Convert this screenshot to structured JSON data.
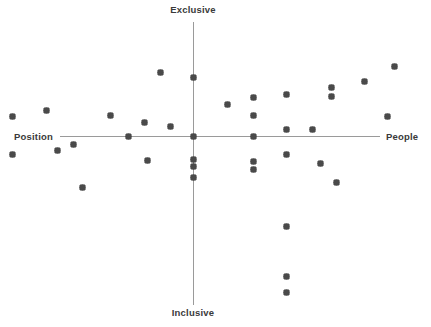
{
  "chart_data": {
    "type": "scatter",
    "title": "",
    "subtitle": "",
    "xlabel": "",
    "ylabel": "",
    "xlim": [
      -100,
      100
    ],
    "ylim": [
      -100,
      100
    ],
    "grid": false,
    "legend": null,
    "legend_position": "none",
    "axis_labels": {
      "top": "Exclusive",
      "bottom": "Inclusive",
      "left": "Position",
      "right": "People"
    },
    "axis_color": "#9a9a9a",
    "marker_color": "#4a4a4a",
    "marker_shape": "diamond",
    "series": [
      {
        "name": "items",
        "points": [
          {
            "x": -89.6,
            "y": 13.4
          },
          {
            "x": -73.1,
            "y": 17.7
          },
          {
            "x": -89.6,
            "y": -12.7
          },
          {
            "x": -67.2,
            "y": -9.9
          },
          {
            "x": -59.7,
            "y": -6.3
          },
          {
            "x": -55.2,
            "y": -36.4
          },
          {
            "x": -41.0,
            "y": 14.1
          },
          {
            "x": -32.1,
            "y": 0.0
          },
          {
            "x": -23.9,
            "y": 9.2
          },
          {
            "x": -22.4,
            "y": -17.6
          },
          {
            "x": -16.4,
            "y": 44.4
          },
          {
            "x": -11.2,
            "y": 7.0
          },
          {
            "x": 0.0,
            "y": 41.0
          },
          {
            "x": 0.0,
            "y": 0.0
          },
          {
            "x": 0.0,
            "y": -16.9
          },
          {
            "x": 0.0,
            "y": -21.8
          },
          {
            "x": 0.0,
            "y": -28.9
          },
          {
            "x": 17.2,
            "y": 22.5
          },
          {
            "x": 29.9,
            "y": 26.8
          },
          {
            "x": 29.9,
            "y": 14.1
          },
          {
            "x": 29.9,
            "y": 0.0
          },
          {
            "x": 29.9,
            "y": -18.3
          },
          {
            "x": 29.9,
            "y": -23.9
          },
          {
            "x": 46.3,
            "y": 28.9
          },
          {
            "x": 46.3,
            "y": 4.9
          },
          {
            "x": 46.3,
            "y": -12.7
          },
          {
            "x": 46.3,
            "y": -63.4
          },
          {
            "x": 46.3,
            "y": -98.6
          },
          {
            "x": 46.3,
            "y": -109.9
          },
          {
            "x": 59.7,
            "y": 4.9
          },
          {
            "x": 63.4,
            "y": -19.7
          },
          {
            "x": 68.7,
            "y": 34.5
          },
          {
            "x": 68.7,
            "y": 27.5
          },
          {
            "x": 71.6,
            "y": -32.4
          },
          {
            "x": 85.1,
            "y": 38.7
          },
          {
            "x": 97.0,
            "y": 13.4
          },
          {
            "x": 100.0,
            "y": 48.6
          }
        ]
      }
    ]
  }
}
